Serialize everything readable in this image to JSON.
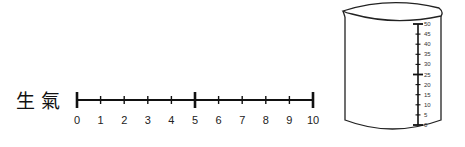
{
  "label": {
    "text": "生氣"
  },
  "number_line": {
    "min": 0,
    "max": 10,
    "ticks": [
      "0",
      "1",
      "2",
      "3",
      "4",
      "5",
      "6",
      "7",
      "8",
      "9",
      "10"
    ],
    "major_ticks": [
      0,
      5,
      10
    ]
  },
  "beaker": {
    "scale_min": 0,
    "scale_max": 50,
    "ticks": [
      "0",
      "5",
      "10",
      "15",
      "20",
      "25",
      "30",
      "35",
      "40",
      "45",
      "50"
    ],
    "major_ticks": [
      0,
      25,
      50
    ]
  }
}
